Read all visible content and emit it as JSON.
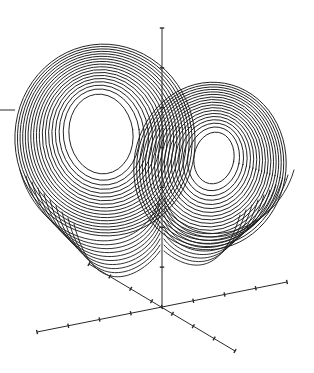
{
  "figure": {
    "colors": {
      "background": "#ffffff",
      "stroke": "#1a1a1a"
    }
  },
  "axes": {
    "origin": [
      162,
      307
    ],
    "z_axis": {
      "from": [
        162,
        307
      ],
      "to": [
        162,
        28
      ],
      "ticks": 7
    },
    "x_axis": {
      "from": [
        37,
        332
      ],
      "to": [
        287,
        282
      ],
      "ticks": 8
    },
    "y_axis": {
      "from": [
        89,
        264
      ],
      "to": [
        235,
        351
      ],
      "ticks": 7
    }
  },
  "attractor": {
    "left_lobe": {
      "center": [
        101,
        134
      ],
      "rx_min": 32,
      "rx_max": 90,
      "ry_min": 40,
      "ry_max": 96,
      "loops": 18
    },
    "right_lobe": {
      "center": [
        214,
        158
      ],
      "rx_min": 20,
      "rx_max": 76,
      "ry_min": 26,
      "ry_max": 84,
      "loops": 18
    }
  },
  "stray_line": {
    "from": [
      0,
      110
    ],
    "to": [
      15,
      110
    ]
  }
}
